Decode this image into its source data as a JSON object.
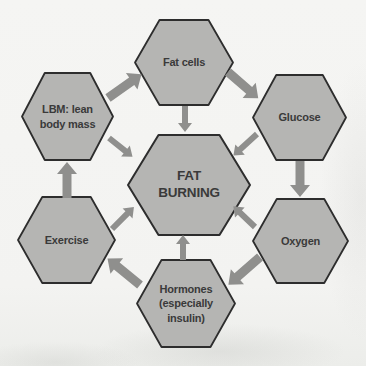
{
  "diagram": {
    "center": {
      "id": "fat-burning",
      "label": "FAT\nBURNING"
    },
    "nodes": [
      {
        "id": "fat-cells",
        "label": "Fat cells"
      },
      {
        "id": "glucose",
        "label": "Glucose"
      },
      {
        "id": "oxygen",
        "label": "Oxygen"
      },
      {
        "id": "hormones",
        "label": "Hormones\n(especially\ninsulin)"
      },
      {
        "id": "exercise",
        "label": "Exercise"
      },
      {
        "id": "lbm",
        "label": "LBM: lean\nbody mass"
      }
    ],
    "outer_arrows": [
      {
        "from": "lbm",
        "to": "fat-cells"
      },
      {
        "from": "fat-cells",
        "to": "glucose"
      },
      {
        "from": "glucose",
        "to": "oxygen"
      },
      {
        "from": "oxygen",
        "to": "hormones"
      },
      {
        "from": "hormones",
        "to": "exercise"
      },
      {
        "from": "exercise",
        "to": "lbm"
      }
    ],
    "inner_arrows": [
      {
        "from": "fat-cells",
        "to": "fat-burning"
      },
      {
        "from": "glucose",
        "to": "fat-burning"
      },
      {
        "from": "oxygen",
        "to": "fat-burning"
      },
      {
        "from": "hormones",
        "to": "fat-burning"
      },
      {
        "from": "exercise",
        "to": "fat-burning"
      },
      {
        "from": "lbm",
        "to": "fat-burning"
      }
    ],
    "colors": {
      "hex_fill": "#b5b5b3",
      "hex_stroke": "#2d2d2d",
      "arrow": "#8f8f8d",
      "text": "#3a3a3a",
      "background": "#f3f3f1"
    }
  }
}
